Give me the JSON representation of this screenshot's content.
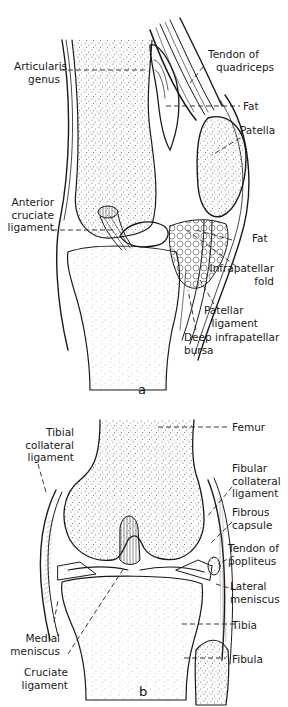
{
  "figure": {
    "panel_a": {
      "letter": "a",
      "view": "sagittal section of knee",
      "labels": {
        "articularis_genus": [
          "Articularis",
          "genus"
        ],
        "tendon_of_quadriceps": [
          "Tendon of",
          "quadriceps"
        ],
        "fat_upper": [
          "Fat"
        ],
        "patella": [
          "Patella"
        ],
        "anterior_cruciate_ligament": [
          "Anterior",
          "cruciate",
          "ligament"
        ],
        "fat_lower": [
          "Fat"
        ],
        "infrapatellar_fold": [
          "Infrapatellar",
          "fold"
        ],
        "patellar_ligament": [
          "Patellar",
          "ligament"
        ],
        "deep_infrapatellar_bursa": [
          "Deep infrapatellar",
          "bursa"
        ]
      }
    },
    "panel_b": {
      "letter": "b",
      "view": "frontal section of knee",
      "labels": {
        "tibial_collateral_ligament": [
          "Tibial",
          "collateral",
          "ligament"
        ],
        "femur": [
          "Femur"
        ],
        "fibular_collateral_ligament": [
          "Fibular",
          "collateral",
          "ligament"
        ],
        "fibrous_capsule": [
          "Fibrous",
          "capsule"
        ],
        "tendon_of_popliteus": [
          "Tendon of",
          "popliteus"
        ],
        "lateral_meniscus": [
          "Lateral",
          "meniscus"
        ],
        "tibia": [
          "Tibia"
        ],
        "medial_meniscus": [
          "Medial",
          "meniscus"
        ],
        "fibula": [
          "Fibula"
        ],
        "cruciate_ligament": [
          "Cruciate",
          "ligament"
        ]
      }
    },
    "colors": {
      "ink": "#1a1a1a",
      "bone_stipple": "#555555",
      "background": "#ffffff"
    }
  }
}
